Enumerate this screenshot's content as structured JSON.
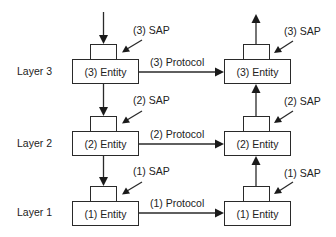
{
  "diagram": {
    "type": "layered-protocol-model",
    "colors": {
      "line": "#2a2a2a",
      "text": "#222222",
      "box_fill": "#ffffff",
      "background": "#ffffff"
    },
    "layers": [
      {
        "label": "Layer 3",
        "left_entity": "(3) Entity",
        "right_entity": "(3) Entity",
        "left_sap": "(3) SAP",
        "right_sap": "(3) SAP",
        "protocol": "(3) Protocol"
      },
      {
        "label": "Layer 2",
        "left_entity": "(2) Entity",
        "right_entity": "(2) Entity",
        "left_sap": "(2) SAP",
        "right_sap": "(2) SAP",
        "protocol": "(2) Protocol"
      },
      {
        "label": "Layer 1",
        "left_entity": "(1) Entity",
        "right_entity": "(1) Entity",
        "left_sap": "(1) SAP",
        "right_sap": "(1) SAP",
        "protocol": "(1) Protocol"
      }
    ],
    "flow": {
      "left_stack_direction": "down",
      "right_stack_direction": "up",
      "protocol_direction": "left-to-right"
    }
  }
}
